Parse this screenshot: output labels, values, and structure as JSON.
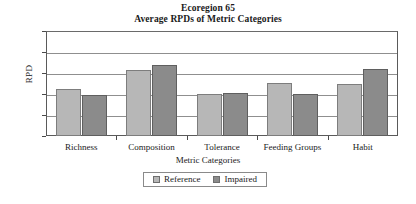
{
  "chart_data": {
    "type": "bar",
    "title": "Ecoregion 65",
    "subtitle": "Average RPDs of Metric Categories",
    "xlabel": "Metric Categories",
    "ylabel": "RPD",
    "categories": [
      "Richness",
      "Composition",
      "Tolerance",
      "Feeding Groups",
      "Habit"
    ],
    "series": [
      {
        "name": "Reference",
        "color": "#b7b7b7",
        "values": [
          22.4,
          31.4,
          20.1,
          25.3,
          24.9
        ]
      },
      {
        "name": "Impaired",
        "color": "#8b8b8b",
        "values": [
          19.6,
          33.9,
          20.7,
          20.1,
          31.8
        ]
      }
    ],
    "ylim": [
      0,
      50
    ],
    "y_ticks": [
      "0",
      "10",
      "20",
      "30",
      "40",
      "50"
    ],
    "grid": true,
    "legend_position": "bottom"
  },
  "legend": {
    "items": [
      {
        "label": "Reference"
      },
      {
        "label": "Impaired"
      }
    ]
  }
}
